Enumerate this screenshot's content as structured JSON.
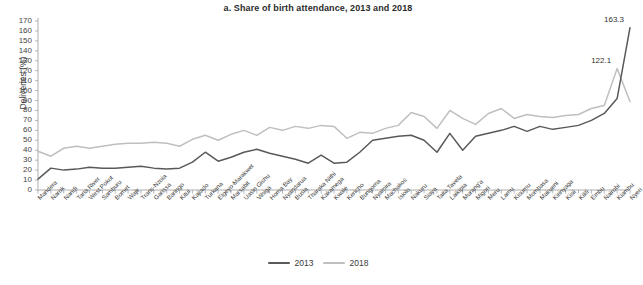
{
  "chart_data": {
    "type": "line",
    "title": "a. Share of birth attendance, 2013 and 2018",
    "xlabel": "",
    "ylabel": "Deliveries (%)",
    "ylim": [
      0,
      170
    ],
    "ytick_step": 10,
    "yticks": [
      0,
      10,
      20,
      30,
      40,
      50,
      60,
      70,
      80,
      90,
      100,
      110,
      120,
      130,
      140,
      150,
      160,
      170
    ],
    "grid": false,
    "legend_position": "bottom",
    "categories": [
      "Mandera",
      "Narok",
      "Nandi",
      "Tana River",
      "West Pokot",
      "Samburu",
      "Bomet",
      "Wajir",
      "Trans-Nzoia",
      "Garissa",
      "Baringo",
      "Kitui",
      "Kajiado",
      "Turkana",
      "Elgeyo-Marakwet",
      "Marsabit",
      "Uasin Gishu",
      "Vihiga",
      "Homa Bay",
      "Nyandarua",
      "Busia",
      "Tharaka Nithi",
      "Kakamega",
      "Kwale",
      "Kericho",
      "Bungoma",
      "Nyamira",
      "Machakos",
      "Isiolo",
      "Nakuru",
      "Siaya",
      "Taita Taveta",
      "Laikipia",
      "Murang'a",
      "Migori",
      "Meru",
      "Lamu",
      "Kisumu",
      "Mombasa",
      "Makueni",
      "Kirinyaga",
      "Kisii",
      "Kilifi",
      "Embu",
      "Nairobi",
      "Kiambu",
      "Nyeri"
    ],
    "series": [
      {
        "name": "2013",
        "color": "#595959",
        "values": [
          11,
          22,
          20,
          21,
          23,
          22,
          22,
          23,
          24,
          22,
          21,
          22,
          28,
          38,
          29,
          33,
          38,
          41,
          37,
          34,
          31,
          27,
          35,
          27,
          28,
          38,
          50,
          52,
          54,
          55,
          50,
          38,
          57,
          40,
          54,
          57,
          60,
          64,
          59,
          64,
          61,
          63,
          65,
          70,
          77,
          92,
          163.3
        ]
      },
      {
        "name": "2018",
        "color": "#bfbfbf",
        "values": [
          39,
          34,
          42,
          44,
          42,
          44,
          46,
          47,
          47,
          48,
          47,
          44,
          51,
          55,
          50,
          56,
          60,
          55,
          63,
          60,
          64,
          62,
          65,
          64,
          52,
          58,
          57,
          62,
          65,
          78,
          74,
          62,
          80,
          72,
          66,
          77,
          82,
          72,
          76,
          74,
          73,
          75,
          76,
          82,
          85,
          122.1,
          89
        ]
      }
    ],
    "annotations": [
      {
        "text": "163.3",
        "series": "2013",
        "category": "Nyeri",
        "value": 163.3
      },
      {
        "text": "122.1",
        "series": "2018",
        "category": "Kiambu",
        "value": 122.1
      }
    ],
    "legend": [
      {
        "label": "2013",
        "color": "#595959"
      },
      {
        "label": "2018",
        "color": "#bfbfbf"
      }
    ]
  }
}
